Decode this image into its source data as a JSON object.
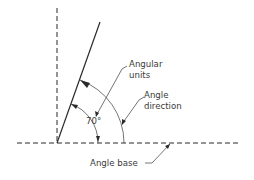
{
  "diagram": {
    "title": "",
    "labels": {
      "angular_units": [
        "Angular",
        "units"
      ],
      "angle_direction": [
        "Angle",
        "direction"
      ],
      "angle_value": "70°",
      "angle_base": "Angle base"
    },
    "colors": {
      "line": "#2a2a2a",
      "text": "#3a3a3a",
      "background": "#ffffff"
    }
  }
}
